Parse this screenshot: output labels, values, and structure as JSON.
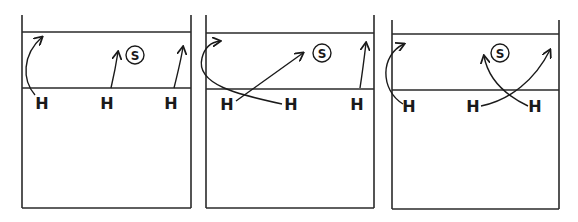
{
  "diagram": {
    "line_color": "#2a2a2a",
    "courts": [
      {
        "id": "court-1",
        "box": {
          "left": 22,
          "right": 191,
          "top": 15,
          "bottom": 208
        },
        "lines_y": [
          32,
          88
        ],
        "setter": {
          "label": "S",
          "cx": 135,
          "cy": 55
        },
        "hitters": [
          {
            "label": "H",
            "x": 42,
            "y": 109
          },
          {
            "label": "H",
            "x": 107,
            "y": 109
          },
          {
            "label": "H",
            "x": 171,
            "y": 109
          }
        ],
        "paths": [
          "M 35 95 C 22 80, 22 55, 42 37",
          "M 111 88 C 114 75, 116 65, 118 52",
          "M 174 88 C 178 72, 181 60, 183 47"
        ],
        "arrow_tips": [
          {
            "x": 42,
            "y": 37,
            "angle": -45
          },
          {
            "x": 118,
            "y": 52,
            "angle": -80
          },
          {
            "x": 183,
            "y": 47,
            "angle": -75
          }
        ]
      },
      {
        "id": "court-2",
        "box": {
          "left": 206,
          "right": 374,
          "top": 15,
          "bottom": 208
        },
        "lines_y": [
          33,
          89
        ],
        "setter": {
          "label": "S",
          "cx": 322,
          "cy": 53
        },
        "hitters": [
          {
            "label": "H",
            "x": 227,
            "y": 110
          },
          {
            "label": "H",
            "x": 291,
            "y": 110
          },
          {
            "label": "H",
            "x": 357,
            "y": 110
          }
        ],
        "paths": [
          "M 282 104 C 240 95, 195 85, 202 58 C 205 46, 212 42, 220 41",
          "M 236 101 L 303 53",
          "M 360 88 C 362 75, 364 60, 366 43"
        ],
        "arrow_tips": [
          {
            "x": 220,
            "y": 41,
            "angle": -10
          },
          {
            "x": 303,
            "y": 53,
            "angle": -35
          },
          {
            "x": 366,
            "y": 43,
            "angle": -85
          }
        ]
      },
      {
        "id": "court-3",
        "box": {
          "left": 392,
          "right": 559,
          "top": 20,
          "bottom": 209
        },
        "lines_y": [
          34,
          90
        ],
        "setter": {
          "label": "S",
          "cx": 500,
          "cy": 53
        },
        "hitters": [
          {
            "label": "H",
            "x": 409,
            "y": 112
          },
          {
            "label": "H",
            "x": 473,
            "y": 112
          },
          {
            "label": "H",
            "x": 535,
            "y": 112
          }
        ],
        "paths": [
          "M 403 104 C 380 90, 380 55, 404 44",
          "M 481 106 C 510 100, 535 80, 550 50",
          "M 528 106 C 505 95, 488 78, 484 56"
        ],
        "arrow_tips": [
          {
            "x": 404,
            "y": 44,
            "angle": -20
          },
          {
            "x": 550,
            "y": 50,
            "angle": -60
          },
          {
            "x": 484,
            "y": 56,
            "angle": -100
          }
        ]
      }
    ]
  }
}
